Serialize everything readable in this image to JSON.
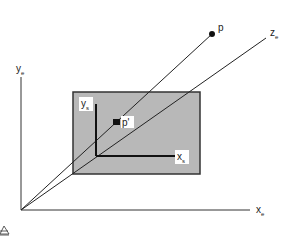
{
  "diagram": {
    "type": "perspective-projection",
    "colors": {
      "background": "#ffffff",
      "lines": "#222222",
      "screen_fill": "#b8b8b8",
      "screen_border": "#333333",
      "label_box": "#ffffff"
    },
    "eye_axes": {
      "y_axis": {
        "label_main": "y",
        "label_sub": "e"
      },
      "x_axis": {
        "label_main": "x",
        "label_sub": "e"
      },
      "z_axis": {
        "label_main": "z",
        "label_sub": "e"
      }
    },
    "screen_axes": {
      "y_axis": {
        "label_main": "y",
        "label_sub": "s"
      },
      "x_axis": {
        "label_main": "x",
        "label_sub": "s"
      }
    },
    "points": {
      "p": {
        "label": "p"
      },
      "p_prime": {
        "label": "p'"
      }
    },
    "icons": {
      "eye": "eye-icon"
    }
  }
}
